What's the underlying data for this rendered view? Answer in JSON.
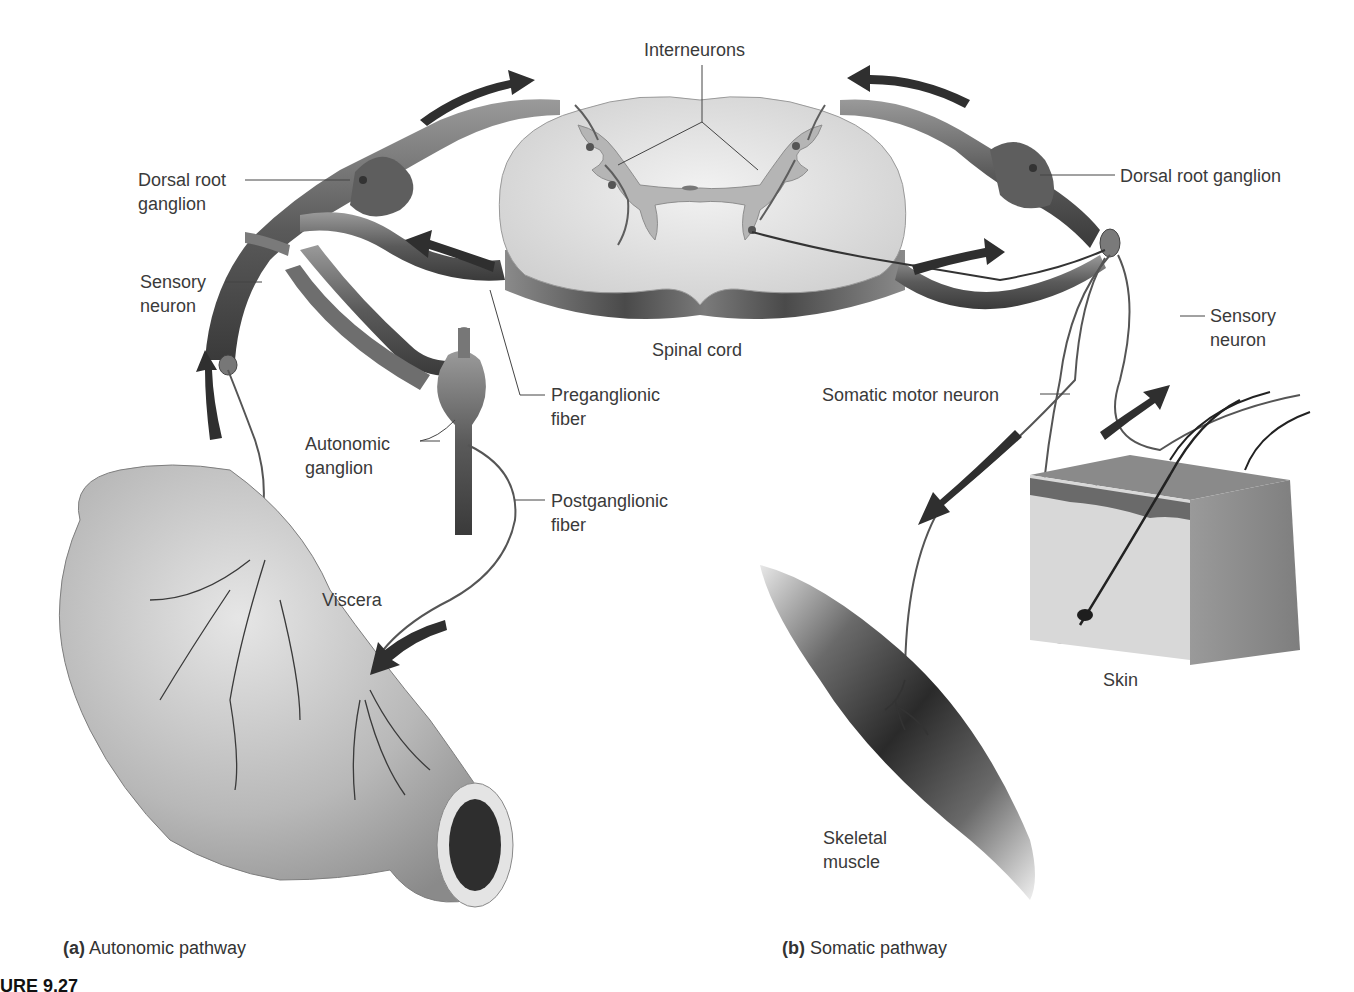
{
  "figure": {
    "caption_fragment": "URE 9.27",
    "panels": [
      {
        "letter": "(a)",
        "title": "Autonomic pathway"
      },
      {
        "letter": "(b)",
        "title": "Somatic pathway"
      }
    ]
  },
  "labels": {
    "interneurons": "Interneurons",
    "spinal_cord": "Spinal cord",
    "dorsal_root_ganglion_left": "Dorsal root\nganglion",
    "dorsal_root_ganglion_right": "Dorsal root ganglion",
    "sensory_neuron_left": "Sensory\nneuron",
    "sensory_neuron_right": "Sensory\nneuron",
    "preganglionic_fiber": "Preganglionic\nfiber",
    "autonomic_ganglion": "Autonomic\nganglion",
    "postganglionic_fiber": "Postganglionic\nfiber",
    "viscera": "Viscera",
    "somatic_motor_neuron": "Somatic motor neuron",
    "skin": "Skin",
    "skeletal_muscle": "Skeletal\nmuscle"
  },
  "colors": {
    "nerve": "#6b6b6b",
    "nerve_dark": "#3c3c3c",
    "cord_white": "#e6e6e6",
    "cord_gray": "#bdbdbd",
    "arrow": "#333333",
    "text": "#3a3a3a"
  }
}
